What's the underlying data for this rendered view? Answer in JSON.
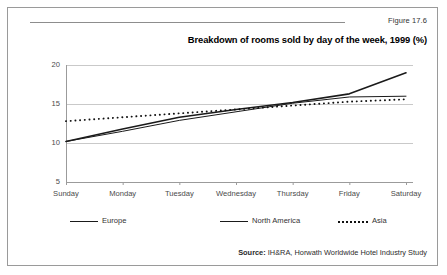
{
  "figure": {
    "number": "Figure 17.6",
    "title": "Breakdown of rooms sold by day of the week, 1999 (%)",
    "source_label": "Source:",
    "source_text": " IH&RA, Horwath Worldwide Hotel Industry Study"
  },
  "legend": [
    {
      "label": "Europe",
      "style": "solid-thin",
      "color": "#1a1a1a"
    },
    {
      "label": "North America",
      "style": "solid-thick",
      "color": "#1a1a1a"
    },
    {
      "label": "Asia",
      "style": "dotted",
      "color": "#111111"
    }
  ],
  "axis": {
    "y_ticks": [
      "5",
      "10",
      "15",
      "20"
    ],
    "x_ticks": [
      "Sunday",
      "Monday",
      "Tuesday",
      "Wednesday",
      "Thursday",
      "Friday",
      "Saturday"
    ]
  },
  "chart_data": {
    "type": "line",
    "title": "Breakdown of rooms sold by day of the week, 1999 (%)",
    "xlabel": "",
    "ylabel": "",
    "categories": [
      "Sunday",
      "Monday",
      "Tuesday",
      "Wednesday",
      "Thursday",
      "Friday",
      "Saturday"
    ],
    "series": [
      {
        "name": "Europe",
        "values": [
          10.2,
          11.5,
          12.9,
          14.0,
          15.1,
          15.9,
          16.0
        ]
      },
      {
        "name": "North America",
        "values": [
          10.2,
          11.8,
          13.3,
          14.3,
          15.2,
          16.3,
          19.0
        ]
      },
      {
        "name": "Asia",
        "values": [
          12.8,
          13.3,
          13.8,
          14.3,
          14.8,
          15.3,
          15.6
        ]
      }
    ],
    "ylim": [
      5,
      20
    ],
    "ytick_values": [
      5,
      10,
      15,
      20
    ],
    "grid": "horizontal",
    "legend_position": "bottom"
  }
}
